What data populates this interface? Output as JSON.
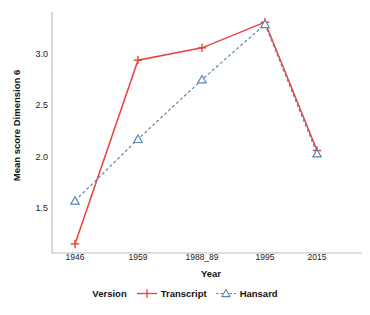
{
  "chart_data": {
    "type": "line",
    "title": "",
    "xlabel": "Year",
    "ylabel": "Mean score Dimension 6",
    "categories": [
      "1946",
      "1959",
      "1988_89",
      "1995",
      "2015"
    ],
    "series": [
      {
        "name": "Transcript",
        "values": [
          1.15,
          2.94,
          3.06,
          3.31,
          2.06
        ],
        "color": "#e8413a",
        "marker": "plus",
        "line_style": "solid"
      },
      {
        "name": "Hansard",
        "values": [
          1.57,
          2.17,
          2.75,
          3.29,
          2.03
        ],
        "color": "#5b87b5",
        "marker": "triangle-open",
        "line_style": "dashed"
      }
    ],
    "y_ticks": [
      1.5,
      2.0,
      2.5,
      3.0
    ],
    "y_tick_labels": [
      "1.5",
      "2.0",
      "2.5",
      "3.0"
    ],
    "ylim": [
      1.05,
      3.45
    ],
    "grid": false,
    "legend_position": "bottom",
    "legend_title": "Version"
  },
  "axes": {
    "y_title": "Mean score Dimension 6",
    "x_title": "Year"
  },
  "legend": {
    "title": "Version",
    "items": [
      {
        "label": "Transcript",
        "key": "red-plus-solid-line"
      },
      {
        "label": "Hansard",
        "key": "blue-triangle-dashed-line"
      }
    ]
  },
  "colors": {
    "transcript": "#e8413a",
    "hansard": "#5b87b5",
    "axis": "#b9b9b9",
    "text": "#111111"
  }
}
